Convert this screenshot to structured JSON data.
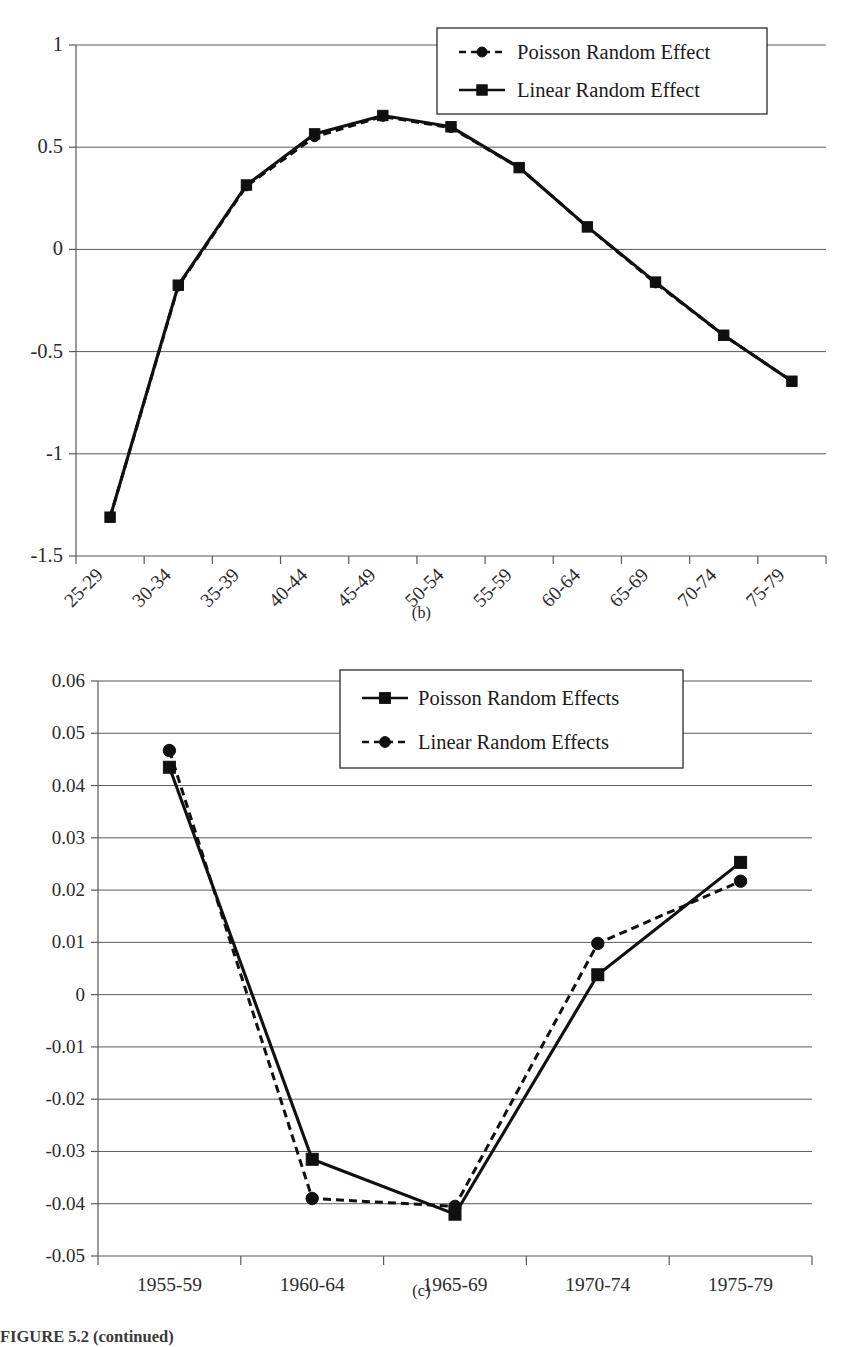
{
  "figure": {
    "caption": "FIGURE 5.2 (continued)"
  },
  "panels": [
    {
      "id": "b",
      "caption": "(b)"
    },
    {
      "id": "c",
      "caption": "(c)"
    }
  ],
  "chart_data": [
    {
      "type": "line",
      "panel": "(b)",
      "title": "",
      "xlabel": "",
      "ylabel": "",
      "categories": [
        "25-29",
        "30-34",
        "35-39",
        "40-44",
        "45-49",
        "50-54",
        "55-59",
        "60-64",
        "65-69",
        "70-74",
        "75-79"
      ],
      "ylim": [
        -1.5,
        1
      ],
      "yticks": [
        1,
        0.5,
        0,
        -0.5,
        -1,
        -1.5
      ],
      "ytick_labels": [
        "1",
        "0.5",
        "0",
        "-0.5",
        "-1",
        "-1.5"
      ],
      "grid": true,
      "legend_position": "top-right",
      "xtick_rotation": -45,
      "series": [
        {
          "name": "Poisson Random Effect",
          "marker": "circle",
          "linestyle": "dashed",
          "values": [
            -1.31,
            -0.18,
            0.31,
            0.55,
            0.65,
            0.595,
            0.4,
            0.11,
            -0.165,
            -0.42,
            -0.645
          ]
        },
        {
          "name": "Linear Random Effect",
          "marker": "square",
          "linestyle": "solid",
          "values": [
            -1.31,
            -0.175,
            0.315,
            0.565,
            0.655,
            0.6,
            0.4,
            0.11,
            -0.16,
            -0.42,
            -0.645
          ]
        }
      ]
    },
    {
      "type": "line",
      "panel": "(c)",
      "title": "",
      "xlabel": "",
      "ylabel": "",
      "categories": [
        "1955-59",
        "1960-64",
        "1965-69",
        "1970-74",
        "1975-79"
      ],
      "ylim": [
        -0.05,
        0.06
      ],
      "yticks": [
        0.06,
        0.05,
        0.04,
        0.03,
        0.02,
        0.01,
        0,
        -0.01,
        -0.02,
        -0.03,
        -0.04,
        -0.05
      ],
      "ytick_labels": [
        "0.06",
        "0.05",
        "0.04",
        "0.03",
        "0.02",
        "0.01",
        "0",
        "-0.01",
        "-0.02",
        "-0.03",
        "-0.04",
        "-0.05"
      ],
      "grid": true,
      "legend_position": "top-center",
      "xtick_rotation": 0,
      "series": [
        {
          "name": "Poisson Random Effects",
          "marker": "square",
          "linestyle": "solid",
          "values": [
            0.0435,
            -0.0315,
            -0.042,
            0.0038,
            0.0253
          ]
        },
        {
          "name": "Linear Random Effects",
          "marker": "circle",
          "linestyle": "dashed",
          "values": [
            0.0467,
            -0.039,
            -0.0405,
            0.0098,
            0.0217
          ]
        }
      ]
    }
  ]
}
